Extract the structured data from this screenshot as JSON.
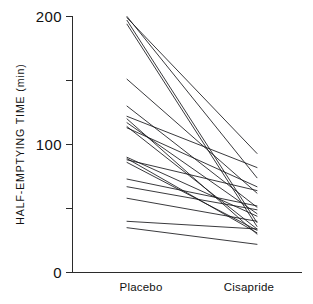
{
  "chart_data": {
    "type": "line",
    "title": "",
    "subtitle": "",
    "xlabel": "",
    "ylabel": "HALF-EMPTYING TIME (min)",
    "categories": [
      "Placebo",
      "Cisapride"
    ],
    "x": [
      0,
      1
    ],
    "xlim": [
      -0.22,
      1.22
    ],
    "ylim": [
      0,
      200
    ],
    "yticks": [
      0,
      50,
      100,
      150,
      200
    ],
    "ytick_labels": [
      "0",
      "100",
      "200"
    ],
    "ytick_labels_shown": [
      0,
      100,
      200
    ],
    "yminor_ticks": [
      50,
      150
    ],
    "grid": false,
    "legend": false,
    "legend_position": "none",
    "plot_style": "paired before-after spaghetti plot, 20 subjects, one line per subject",
    "series": [
      {
        "name": "subject-1",
        "values": [
          200,
          74
        ]
      },
      {
        "name": "subject-2",
        "values": [
          199,
          93
        ]
      },
      {
        "name": "subject-3",
        "values": [
          197,
          39
        ]
      },
      {
        "name": "subject-4",
        "values": [
          194,
          36
        ]
      },
      {
        "name": "subject-5",
        "values": [
          151,
          62
        ]
      },
      {
        "name": "subject-6",
        "values": [
          130,
          51
        ]
      },
      {
        "name": "subject-7",
        "values": [
          122,
          82
        ]
      },
      {
        "name": "subject-8",
        "values": [
          120,
          30
        ]
      },
      {
        "name": "subject-9",
        "values": [
          117,
          46
        ]
      },
      {
        "name": "subject-10",
        "values": [
          114,
          34
        ]
      },
      {
        "name": "subject-11",
        "values": [
          113,
          67
        ]
      },
      {
        "name": "subject-12",
        "values": [
          90,
          44
        ]
      },
      {
        "name": "subject-13",
        "values": [
          89,
          31
        ]
      },
      {
        "name": "subject-14",
        "values": [
          88,
          64
        ]
      },
      {
        "name": "subject-15",
        "values": [
          86,
          33
        ]
      },
      {
        "name": "subject-16",
        "values": [
          73,
          52
        ]
      },
      {
        "name": "subject-17",
        "values": [
          67,
          49
        ]
      },
      {
        "name": "subject-18",
        "values": [
          58,
          40
        ]
      },
      {
        "name": "subject-19",
        "values": [
          40,
          34
        ]
      },
      {
        "name": "subject-20",
        "values": [
          35,
          22
        ]
      }
    ]
  },
  "axis": {
    "y_title": "HALF-EMPTYING TIME (min)",
    "tick_0": "0",
    "tick_100": "100",
    "tick_200": "200"
  },
  "categories": {
    "left": "Placebo",
    "right": "Cisapride"
  },
  "colors": {
    "line": "#17171a",
    "axis": "#2b2b2b",
    "background": "#ffffff"
  }
}
